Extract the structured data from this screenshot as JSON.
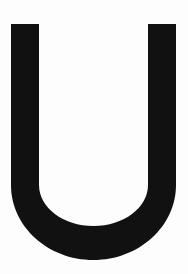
{
  "canvas": {
    "width": 188,
    "height": 274,
    "background_color": "#fdfdfd",
    "description": "single-letter-glyph"
  },
  "glyph": {
    "character": "U",
    "name": "latin-capital-letter-u",
    "case": "uppercase",
    "color": "#111111",
    "stroke_color": "#111111",
    "style": "sans-serif-grotesque",
    "weight": "bold",
    "bounds": {
      "left": 11,
      "top": 24,
      "right": 176,
      "bottom": 260,
      "width": 165,
      "height": 236
    },
    "metrics": {
      "stem_width": 28,
      "bottom_stroke_thickness": 33,
      "straight_stem_end_y": 185,
      "counter_bottom_y": 226,
      "left_stem_x": 11,
      "right_stem_x": 148
    }
  }
}
